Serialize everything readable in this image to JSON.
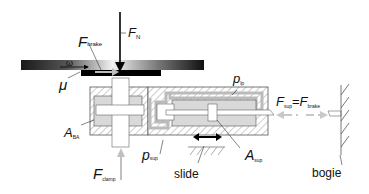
{
  "diagram": {
    "labels": {
      "normal_force": {
        "main": "F",
        "sub": "N"
      },
      "brake_force": {
        "main": "F",
        "sub": "brake"
      },
      "angular_velocity": "ω",
      "friction_coefficient": "μ",
      "leakage_pressure": {
        "main": "p",
        "sub": "lp"
      },
      "area_ba": {
        "main": "A",
        "sub": "BA"
      },
      "support_pressure": {
        "main": "p",
        "sub": "sup"
      },
      "clamp_force": {
        "main": "F",
        "sub": "clamp"
      },
      "slide": "slide",
      "support_area": {
        "main": "A",
        "sub": "sup"
      },
      "support_force_eq": {
        "left_main": "F",
        "left_sub": "sup",
        "eq": "=",
        "right_main": "F",
        "right_sub": "brake"
      },
      "bogie": "bogie"
    },
    "colors": {
      "disc_dark": "#1a1a1a",
      "disc_light": "#e8e8e8",
      "pad": "#000000",
      "fluid": "#d9d9d9",
      "hatch": "#888888",
      "outline": "#555555",
      "arrow_gray": "#bdbdbd"
    }
  }
}
